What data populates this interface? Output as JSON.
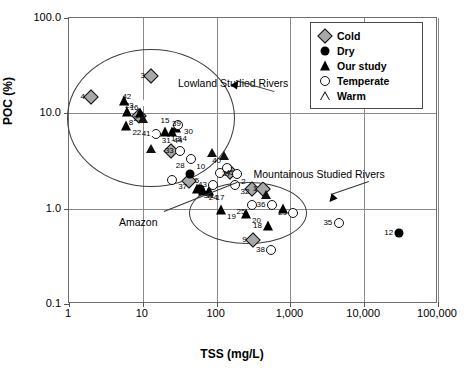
{
  "chart_data": {
    "type": "scatter",
    "title": "",
    "xlabel": "TSS (mg/L)",
    "ylabel": "POC (%)",
    "xscale": "log",
    "yscale": "log",
    "xlim": [
      1,
      100000
    ],
    "ylim": [
      0.1,
      100.0
    ],
    "grid": true,
    "xticks": [
      1,
      10,
      100,
      1000,
      10000,
      100000
    ],
    "xticklabels": [
      "1",
      "10",
      "100",
      "1,000",
      "10,000",
      "100,000"
    ],
    "yticks": [
      0.1,
      1.0,
      10.0,
      100.0
    ],
    "yticklabels": [
      "0.1",
      "1.0",
      "10.0",
      "100.0"
    ],
    "legend_position": "top-right",
    "series": [
      {
        "name": "Cold",
        "marker": "diamond-gray",
        "color": "#a8a8a8",
        "points": [
          {
            "label": "4",
            "x": 2.0,
            "y": 15.0,
            "lx": -1,
            "ly": 0
          },
          {
            "label": "3",
            "x": 13.0,
            "y": 24.5,
            "lx": -1,
            "ly": 0
          },
          {
            "label": "8",
            "x": 9.0,
            "y": 9.3,
            "lx": -1,
            "ly": 1
          },
          {
            "label": "6",
            "x": 24.0,
            "y": 4.0,
            "lx": 1,
            "ly": 0
          },
          {
            "label": "5",
            "x": 42.0,
            "y": 1.95,
            "lx": 1,
            "ly": 0
          },
          {
            "label": "7",
            "x": 150.0,
            "y": 2.45,
            "lx": -1,
            "ly": 0
          },
          {
            "label": "2",
            "x": 300.0,
            "y": 1.6,
            "lx": -1,
            "ly": -1
          },
          {
            "label": "1",
            "x": 430.0,
            "y": 1.6,
            "lx": -1,
            "ly": 0
          },
          {
            "label": "9",
            "x": 310.0,
            "y": 0.47,
            "lx": -1,
            "ly": 0
          }
        ]
      },
      {
        "name": "Dry",
        "marker": "circle-filled",
        "color": "#000000",
        "points": [
          {
            "label": "10",
            "x": 44.0,
            "y": 2.3,
            "lx": 1,
            "ly": -1
          },
          {
            "label": "11",
            "x": 60.0,
            "y": 1.6,
            "lx": 1,
            "ly": 1
          },
          {
            "label": "12",
            "x": 30000.0,
            "y": 0.55,
            "lx": -1,
            "ly": 0
          }
        ]
      },
      {
        "name": "Our study",
        "marker": "triangle-filled",
        "color": "#000000",
        "points": [
          {
            "label": "16",
            "x": 5.5,
            "y": 13.5,
            "lx": 1,
            "ly": 1
          },
          {
            "label": "21",
            "x": 6.2,
            "y": 10.3,
            "lx": 1,
            "ly": 1
          },
          {
            "label": "22",
            "x": 6.0,
            "y": 7.3,
            "lx": 1,
            "ly": 1
          },
          {
            "label": "23",
            "x": 9.2,
            "y": 10.0,
            "lx": -1,
            "ly": -1
          },
          {
            "label": "13",
            "x": 20.0,
            "y": 6.4,
            "lx": 1,
            "ly": 1
          },
          {
            "label": "14",
            "x": 25.0,
            "y": 6.4,
            "lx": 1,
            "ly": 1
          },
          {
            "label": "15",
            "x": 28.0,
            "y": 7.0,
            "lx": -1,
            "ly": -1
          },
          {
            "label": "34",
            "x": 55.0,
            "y": 1.6,
            "lx": 1,
            "ly": 1
          },
          {
            "label": "24",
            "x": 65.0,
            "y": 1.55,
            "lx": 1,
            "ly": 1
          },
          {
            "label": "17",
            "x": 80.0,
            "y": 1.55,
            "lx": 1,
            "ly": 1
          },
          {
            "label": "19",
            "x": 115.0,
            "y": 0.98,
            "lx": 1,
            "ly": 1
          },
          {
            "label": "20",
            "x": 250.0,
            "y": 0.87,
            "lx": 1,
            "ly": 1
          },
          {
            "label": "18",
            "x": 500.0,
            "y": 0.66,
            "lx": -1,
            "ly": 0
          },
          {
            "label": "26",
            "x": 800.0,
            "y": 1.0,
            "lx": 0,
            "ly": 0
          }
        ]
      },
      {
        "name": "Temperate",
        "marker": "circle-open",
        "color": "#ffffff",
        "points": [
          {
            "label": "31",
            "x": 15.0,
            "y": 6.1,
            "lx": 1,
            "ly": 1
          },
          {
            "label": "30",
            "x": 30.0,
            "y": 7.6,
            "lx": 1,
            "ly": 1
          },
          {
            "label": "33",
            "x": 32.0,
            "y": 4.0,
            "lx": -1,
            "ly": 0
          },
          {
            "label": "28",
            "x": 45.0,
            "y": 3.3,
            "lx": -1,
            "ly": 1
          },
          {
            "label": "37",
            "x": 25.0,
            "y": 2.0,
            "lx": 1,
            "ly": 1
          },
          {
            "label": "40",
            "x": 140.0,
            "y": 2.65,
            "lx": -1,
            "ly": -1
          },
          {
            "label": "45",
            "x": 110.0,
            "y": 2.35,
            "lx": 1,
            "ly": 0
          },
          {
            "label": "27",
            "x": 190.0,
            "y": 2.3,
            "lx": -1,
            "ly": 0
          },
          {
            "label": "43",
            "x": 90.0,
            "y": 1.75,
            "lx": -1,
            "ly": 0
          },
          {
            "label": "32",
            "x": 175.0,
            "y": 1.75,
            "lx": 1,
            "ly": 1
          },
          {
            "label": "25",
            "x": 300.0,
            "y": 1.1,
            "lx": -1,
            "ly": 1
          },
          {
            "label": "36",
            "x": 560.0,
            "y": 1.1,
            "lx": -1,
            "ly": 0
          },
          {
            "label": "29",
            "x": 1100.0,
            "y": 0.9,
            "lx": -1,
            "ly": 0
          },
          {
            "label": "35",
            "x": 4500.0,
            "y": 0.7,
            "lx": -1,
            "ly": 0
          },
          {
            "label": "38",
            "x": 550.0,
            "y": 0.37,
            "lx": -1,
            "ly": 0
          }
        ]
      },
      {
        "name": "Warm",
        "marker": "triangle-open",
        "color": "#ffffff",
        "points": [
          {
            "label": "42",
            "x": 8.5,
            "y": 15.0,
            "lx": -1,
            "ly": 0
          },
          {
            "label": "41",
            "x": 8.0,
            "y": 7.2,
            "lx": 1,
            "ly": 1
          },
          {
            "label": "39",
            "x": 40.0,
            "y": 6.6,
            "lx": -1,
            "ly": -1
          },
          {
            "label": "44",
            "x": 42.0,
            "y": 6.1,
            "lx": -1,
            "ly": 1
          },
          {
            "label": "45b",
            "x": 115.0,
            "y": 2.35,
            "lx": 0,
            "ly": 0
          }
        ]
      }
    ],
    "annotations": [
      {
        "text": "Lowland Studied Rivers",
        "x": 30,
        "y": 23.5
      },
      {
        "text": "Mountainous Studied Rivers",
        "x": 1100,
        "y": 2.6
      },
      {
        "text": "Amazon",
        "x": 6.5,
        "y": 0.82
      }
    ],
    "ellipses": [
      {
        "name": "lowland-ellipse",
        "cx": 13,
        "cy": 9.0,
        "rx_px": 83,
        "ry_px": 68
      },
      {
        "name": "mountainous-ellipse",
        "cx": 270,
        "cy": 0.9,
        "rx_px": 58,
        "ry_px": 30
      }
    ]
  },
  "legend": {
    "items": [
      {
        "label": "Cold",
        "marker": "diamond-gray"
      },
      {
        "label": "Dry",
        "marker": "circle-filled"
      },
      {
        "label": "Our study",
        "marker": "triangle-filled"
      },
      {
        "label": "Temperate",
        "marker": "circle-open"
      },
      {
        "label": "Warm",
        "marker": "triangle-open"
      }
    ]
  }
}
